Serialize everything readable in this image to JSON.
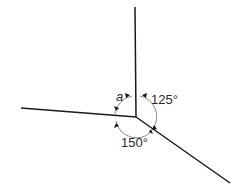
{
  "diagram": {
    "angles": [
      {
        "label": "a",
        "between": [
          "up line",
          "left line"
        ]
      },
      {
        "label": "125°",
        "between": [
          "up line",
          "lower-right line"
        ]
      },
      {
        "label": "150°",
        "between": [
          "left line",
          "lower-right line"
        ]
      }
    ],
    "colors": {
      "line": "#1a1a1a",
      "arc": "#8a8a8a"
    }
  }
}
